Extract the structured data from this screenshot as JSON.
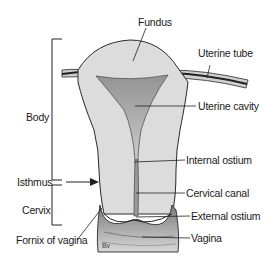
{
  "diagram": {
    "type": "anatomical illustration",
    "colors": {
      "tissue": "#d9d9d9",
      "tissue_light": "#e8e8e8",
      "cavity": "#a8a8a8",
      "outline": "#2a2a2a",
      "text": "#1a1a1a"
    },
    "labels_right": {
      "fundus": "Fundus",
      "uterine_tube": "Uterine tube",
      "uterine_cavity": "Uterine cavity",
      "internal_ostium": "Internal ostium",
      "cervical_canal": "Cervical canal",
      "external_ostium": "External ostium",
      "vagina": "Vagina"
    },
    "labels_left": {
      "body": "Body",
      "isthmus": "Isthmus",
      "cervix": "Cervix",
      "fornix_of_vagina": "Fornix of vagina"
    },
    "signature": "Bv"
  }
}
